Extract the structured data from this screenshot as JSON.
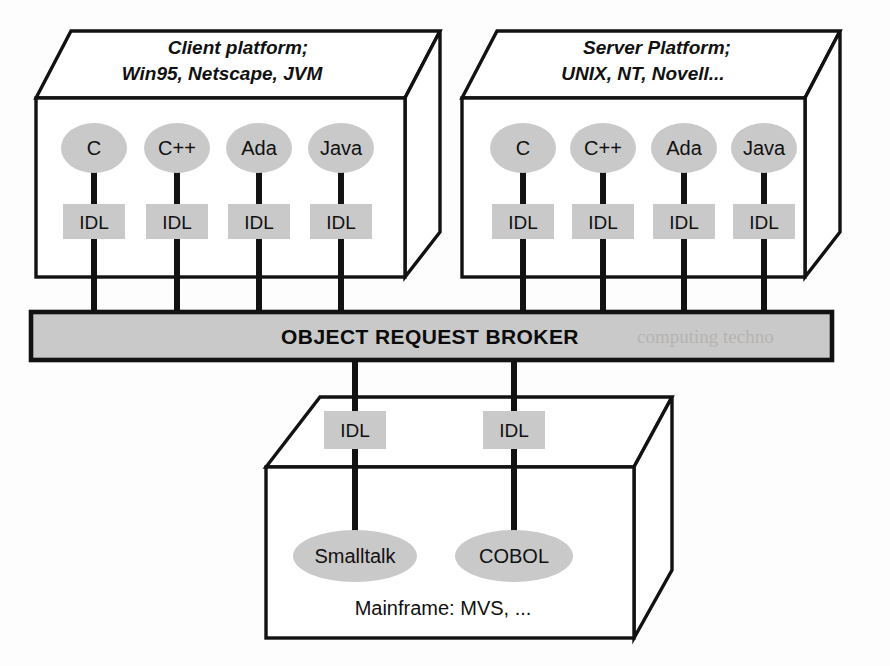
{
  "diagram": {
    "colors": {
      "fill_gray": "#c9c9c9",
      "stroke_black": "#121212",
      "page_white": "#ffffff",
      "bleed_gray": "#b4b0ad"
    },
    "client_platform": {
      "label_line1": "Client platform;",
      "label_line2": "Win95, Netscape, JVM",
      "languages": [
        "C",
        "C++",
        "Ada",
        "Java"
      ],
      "idl_labels": [
        "IDL",
        "IDL",
        "IDL",
        "IDL"
      ]
    },
    "server_platform": {
      "label_line1": "Server Platform;",
      "label_line2": "UNIX, NT, Novell...",
      "languages": [
        "C",
        "C++",
        "Ada",
        "Java"
      ],
      "idl_labels": [
        "IDL",
        "IDL",
        "IDL",
        "IDL"
      ]
    },
    "orb": {
      "label": "OBJECT REQUEST BROKER",
      "bleed_through_text": "computing techno"
    },
    "mainframe_platform": {
      "label": "Mainframe: MVS, ...",
      "idl_labels": [
        "IDL",
        "IDL"
      ],
      "languages": [
        "Smalltalk",
        "COBOL"
      ]
    }
  }
}
